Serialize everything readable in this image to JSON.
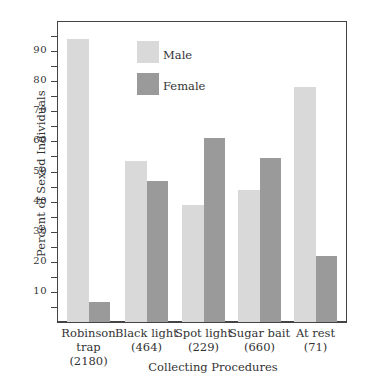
{
  "chart_data": {
    "type": "bar",
    "title": "",
    "xlabel": "Collecting Procedures",
    "ylabel": "Percent of Sexed Individuals",
    "ylim": [
      0,
      100
    ],
    "yticks_major": [
      10,
      20,
      30,
      40,
      50,
      60,
      70,
      80,
      90
    ],
    "yticks_minor": [
      5,
      15,
      25,
      35,
      45,
      55,
      65,
      75,
      85,
      95
    ],
    "grid": false,
    "legend_position": "upper center",
    "categories": [
      "Robinson trap",
      "Black light",
      "Spot light",
      "Sugar bait",
      "At rest"
    ],
    "category_counts": [
      "(2180)",
      "(464)",
      "(229)",
      "(660)",
      "(71)"
    ],
    "series": [
      {
        "name": "Male",
        "color": "#d9d9d9",
        "values": [
          94,
          53.5,
          39,
          44,
          78
        ]
      },
      {
        "name": "Female",
        "color": "#9a9a9a",
        "values": [
          6.5,
          47,
          61,
          54.5,
          22
        ]
      }
    ]
  }
}
